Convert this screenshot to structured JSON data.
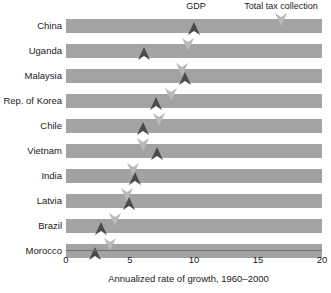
{
  "chart_data": {
    "type": "bar",
    "title": "",
    "xlabel": "Annualized rate of growth, 1960–2000",
    "ylabel": "",
    "xlim": [
      0,
      20
    ],
    "xticks": [
      0,
      5,
      10,
      15,
      20
    ],
    "xtick_labels": [
      "0",
      "5",
      "10",
      "15",
      "20"
    ],
    "grid": false,
    "legend_position": "top",
    "categories": [
      "China",
      "Uganda",
      "Malaysia",
      "Rep. of Korea",
      "Chile",
      "Vietnam",
      "India",
      "Latvia",
      "Brazil",
      "Morocco"
    ],
    "series": [
      {
        "name": "GDP",
        "marker": "up-arrow-dark",
        "color": "#4a4a4a",
        "values": [
          10.0,
          6.1,
          9.3,
          7.0,
          6.0,
          7.1,
          5.4,
          4.9,
          2.7,
          2.3
        ]
      },
      {
        "name": "Total tax collection",
        "marker": "down-arrow-light",
        "color": "#b9b9b9",
        "values": [
          16.8,
          9.5,
          9.1,
          8.2,
          7.3,
          6.0,
          5.2,
          4.8,
          3.8,
          3.4
        ]
      }
    ]
  },
  "legend": {
    "gdp_label": "GDP",
    "tax_label": "Total tax collection"
  },
  "axis": {
    "title": "Annualized rate of growth, 1960–2000",
    "ticks": [
      "0",
      "5",
      "10",
      "15",
      "20"
    ]
  },
  "colors": {
    "bar": "#a3a3a3",
    "gdp_marker": "#4a4a4a",
    "tax_marker": "#b9b9b9",
    "axis_line": "#6f6f6f",
    "text": "#1a1a1a",
    "background": "#ffffff"
  }
}
